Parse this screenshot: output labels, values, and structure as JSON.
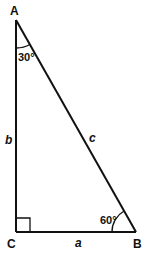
{
  "diagram": {
    "type": "right-triangle",
    "vertices": {
      "A": {
        "label": "A"
      },
      "B": {
        "label": "B"
      },
      "C": {
        "label": "C"
      }
    },
    "sides": {
      "a": {
        "label": "a",
        "between": "C-B"
      },
      "b": {
        "label": "b",
        "between": "A-C"
      },
      "c": {
        "label": "c",
        "between": "A-B"
      }
    },
    "angles": {
      "A": {
        "label": "30°"
      },
      "B": {
        "label": "60°"
      },
      "C": {
        "label": "right-angle"
      }
    },
    "colors": {
      "stroke": "#111111",
      "background": "#ffffff"
    }
  }
}
